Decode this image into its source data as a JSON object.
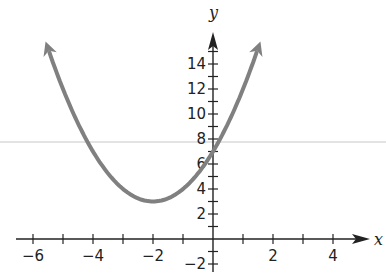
{
  "chart_data": {
    "type": "line",
    "title": "",
    "xlabel": "x",
    "ylabel": "y",
    "function": "y = (x + 2)^2 + 3",
    "vertex": [
      -2,
      3
    ],
    "y_intercept": 7,
    "xlim": [
      -6.5,
      5.5
    ],
    "ylim": [
      -2,
      16
    ],
    "x_ticks": [
      -6,
      -5,
      -4,
      -3,
      -2,
      -1,
      1,
      2,
      3,
      4
    ],
    "x_tick_labels": [
      "−6",
      "−4",
      "−2",
      "2",
      "4"
    ],
    "x_tick_label_values": [
      -6,
      -4,
      -2,
      2,
      4
    ],
    "y_ticks": [
      -2,
      -1,
      1,
      2,
      3,
      4,
      5,
      6,
      7,
      8,
      9,
      10,
      11,
      12,
      13,
      14,
      15
    ],
    "y_tick_labels": [
      "−2",
      "2",
      "4",
      "6",
      "8",
      "10",
      "12",
      "14"
    ],
    "y_tick_label_values": [
      -2,
      2,
      4,
      6,
      8,
      10,
      12,
      14
    ],
    "series": [
      {
        "name": "parabola",
        "x": [
          -5.6,
          -5,
          -4,
          -3,
          -2,
          -1,
          0,
          1,
          1.6
        ],
        "y": [
          15.96,
          12,
          7,
          4,
          3,
          4,
          7,
          12,
          15.96
        ],
        "arrows_both_ends": true,
        "color": "#808080"
      }
    ],
    "reference_line": {
      "y": 7.8,
      "color": "#c8c8c8",
      "orientation": "horizontal"
    },
    "grid": false,
    "legend": null
  }
}
